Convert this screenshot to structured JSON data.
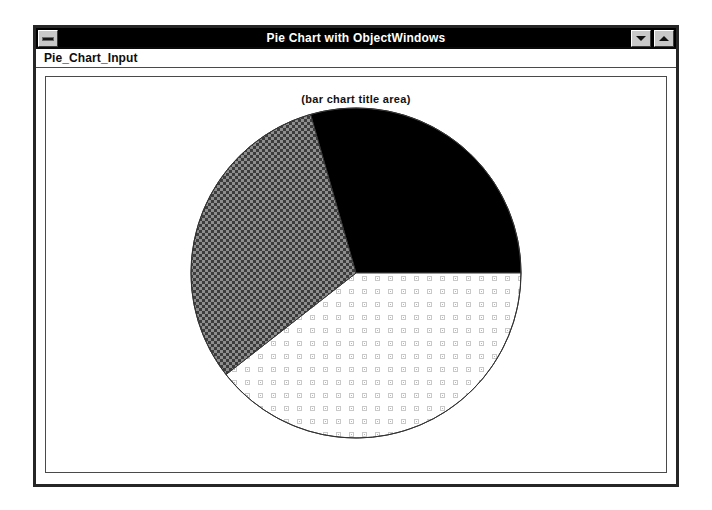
{
  "window": {
    "title": "Pie Chart with ObjectWindows",
    "sysmenu_icon": "window-menu-bar-icon",
    "minimize_icon": "minimize-triangle-down-icon",
    "maximize_icon": "maximize-triangle-up-icon"
  },
  "menu": {
    "items": [
      {
        "label": "Pie_Chart_Input"
      }
    ]
  },
  "chart_data": {
    "type": "pie",
    "title": "(bar chart title area)",
    "xlabel": "",
    "ylabel": "",
    "legend": "none",
    "grid": false,
    "center": {
      "x": 355,
      "y": 272
    },
    "radius": 165,
    "start_angle_deg": -16,
    "categories": [
      "Slice 1",
      "Slice 2",
      "Slice 3"
    ],
    "values": [
      29.4,
      39.4,
      31.2
    ],
    "slices": [
      {
        "name": "Slice 1",
        "fill_style": "solid-black",
        "color": "#000000",
        "start_deg": -16,
        "end_deg": 90,
        "sweep_deg": 106,
        "percent": 29.4
      },
      {
        "name": "Slice 2",
        "fill_style": "light-dotted-grid",
        "color": "#e8e8e8",
        "start_deg": 90,
        "end_deg": 232,
        "sweep_deg": 142,
        "percent": 39.4
      },
      {
        "name": "Slice 3",
        "fill_style": "dark-checkered",
        "color": "#6e6e6e",
        "start_deg": 232,
        "end_deg": 344,
        "sweep_deg": 112,
        "percent": 31.2
      }
    ],
    "outline_color": "#333333"
  },
  "colors": {
    "titlebar_bg": "#000000",
    "titlebar_fg": "#ffffff",
    "window_border": "#262626",
    "client_bg": "#ffffff",
    "button_face": "#c8c8c8"
  }
}
